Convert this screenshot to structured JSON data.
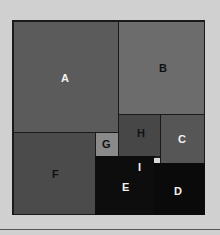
{
  "diagram": {
    "type": "treemap",
    "cells": {
      "A": {
        "label": "A"
      },
      "B": {
        "label": "B"
      },
      "C": {
        "label": "C"
      },
      "D": {
        "label": "D"
      },
      "E": {
        "label": "E"
      },
      "F": {
        "label": "F"
      },
      "G": {
        "label": "G"
      },
      "H": {
        "label": "H"
      },
      "I": {
        "label": "I"
      }
    }
  }
}
